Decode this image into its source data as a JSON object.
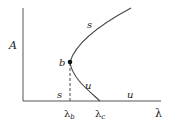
{
  "diagram": {
    "type": "bifurcation-diagram",
    "axes": {
      "y_label": "A",
      "x_label": "λ"
    },
    "points": {
      "bifurcation_point": {
        "label": "b"
      }
    },
    "branch_labels": {
      "upper_branch": "s",
      "middle_branch": "u",
      "axis_left": "s",
      "axis_right": "u"
    },
    "ticks": {
      "lambda_b": {
        "main": "λ",
        "sub": "b"
      },
      "lambda_c": {
        "main": "λ",
        "sub": "c"
      }
    },
    "colors": {
      "line": "#444444",
      "point": "#111111"
    }
  }
}
